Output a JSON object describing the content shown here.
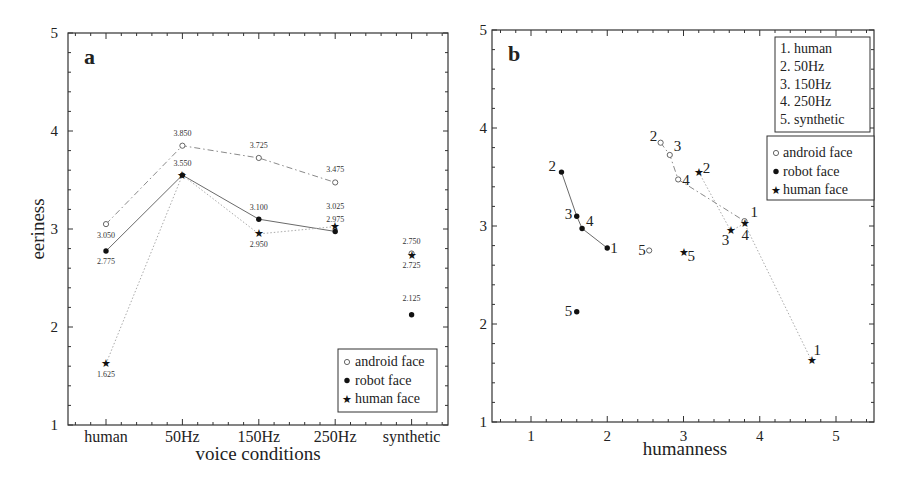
{
  "chart_data": [
    {
      "type": "line",
      "panel_label": "a",
      "title": "",
      "xlabel": "voice conditions",
      "ylabel": "eeriness",
      "ylim": [
        1,
        5
      ],
      "yticks": [
        "1",
        "2",
        "3",
        "4",
        "5"
      ],
      "categories": [
        "human",
        "50Hz",
        "150Hz",
        "250Hz",
        "synthetic"
      ],
      "grid": false,
      "legend_position": "lower right",
      "series": [
        {
          "name": "android face",
          "marker": "open-circle",
          "linestyle": "dash-dot",
          "values": [
            3.05,
            3.85,
            3.725,
            3.475,
            2.75
          ],
          "connected": [
            true,
            true,
            true,
            true,
            false
          ]
        },
        {
          "name": "robot face",
          "marker": "filled-circle",
          "linestyle": "solid",
          "values": [
            2.775,
            3.55,
            3.1,
            2.975,
            2.125
          ],
          "connected": [
            true,
            true,
            true,
            true,
            false
          ]
        },
        {
          "name": "human face",
          "marker": "star",
          "linestyle": "dotted",
          "values": [
            1.625,
            3.55,
            2.95,
            3.025,
            2.725
          ],
          "connected": [
            true,
            true,
            true,
            true,
            false
          ]
        }
      ],
      "data_labels": {
        "android face": [
          "3.050",
          "3.850",
          "3.725",
          "3.475",
          "2.750"
        ],
        "robot face": [
          "2.775",
          "3.550",
          "3.100",
          "2.975",
          "2.125"
        ],
        "human face": [
          "1.625",
          "",
          "2.950",
          "3.025",
          "2.725"
        ]
      },
      "legend": [
        "android face",
        "robot face",
        "human face"
      ]
    },
    {
      "type": "scatter",
      "panel_label": "b",
      "title": "",
      "xlabel": "humanness",
      "ylabel": "",
      "xlim": [
        0.5,
        5.5
      ],
      "ylim": [
        1,
        5
      ],
      "xticks": [
        "1",
        "2",
        "3",
        "4",
        "5"
      ],
      "yticks": [
        "1",
        "2",
        "3",
        "4",
        "5"
      ],
      "grid": false,
      "condition_legend": [
        "1. human",
        "2. 50Hz",
        "3. 150Hz",
        "4. 250Hz",
        "5. synthetic"
      ],
      "legend": [
        "android face",
        "robot face",
        "human face"
      ],
      "series": [
        {
          "name": "android face",
          "marker": "open-circle",
          "linestyle": "dash-dot",
          "points": [
            {
              "label": "1",
              "x": 3.8,
              "y": 3.05
            },
            {
              "label": "2",
              "x": 2.7,
              "y": 3.85
            },
            {
              "label": "3",
              "x": 2.82,
              "y": 3.725
            },
            {
              "label": "4",
              "x": 2.93,
              "y": 3.475
            },
            {
              "label": "5",
              "x": 2.55,
              "y": 2.75
            }
          ]
        },
        {
          "name": "robot face",
          "marker": "filled-circle",
          "linestyle": "solid",
          "points": [
            {
              "label": "1",
              "x": 2.0,
              "y": 2.775
            },
            {
              "label": "2",
              "x": 1.4,
              "y": 3.55
            },
            {
              "label": "3",
              "x": 1.6,
              "y": 3.1
            },
            {
              "label": "4",
              "x": 1.67,
              "y": 2.975
            },
            {
              "label": "5",
              "x": 1.6,
              "y": 2.125
            }
          ]
        },
        {
          "name": "human face",
          "marker": "star",
          "linestyle": "dotted",
          "points": [
            {
              "label": "1",
              "x": 4.68,
              "y": 1.625
            },
            {
              "label": "2",
              "x": 3.2,
              "y": 3.55
            },
            {
              "label": "3",
              "x": 3.62,
              "y": 2.95
            },
            {
              "label": "4",
              "x": 3.8,
              "y": 3.025
            },
            {
              "label": "5",
              "x": 3.0,
              "y": 2.725
            }
          ]
        }
      ]
    }
  ],
  "panel_a": {
    "label": "a",
    "xlabel": "voice conditions",
    "ylabel": "eeriness",
    "legend": {
      "android": "android face",
      "robot": "robot face",
      "human": "human face"
    }
  },
  "panel_b": {
    "label": "b",
    "xlabel": "humanness",
    "conditions": [
      "1. human",
      "2. 50Hz",
      "3. 150Hz",
      "4. 250Hz",
      "5. synthetic"
    ],
    "legend": {
      "android": "android face",
      "robot": "robot face",
      "human": "human face"
    }
  }
}
